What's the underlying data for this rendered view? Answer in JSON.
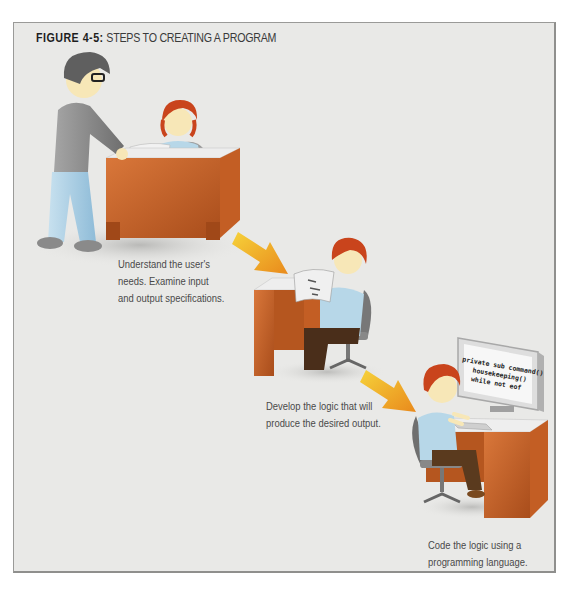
{
  "figure": {
    "label": "FIGURE 4-5:",
    "title": "STEPS TO CREATING A PROGRAM"
  },
  "steps": [
    {
      "caption_lines": [
        "Understand the user's",
        "needs. Examine input",
        "and output specifications."
      ],
      "scene": "analyst-meeting-user-at-desk"
    },
    {
      "caption_lines": [
        "Develop the logic that will",
        "produce the desired output."
      ],
      "scene": "programmer-reading-document-at-desk"
    },
    {
      "caption_lines": [
        "Code the logic using a",
        "programming language."
      ],
      "scene": "programmer-typing-at-computer"
    }
  ],
  "monitor_code": {
    "lines": [
      "private sub command()",
      "housekeeping()",
      "while not eof"
    ]
  },
  "arrows": [
    "arrow-step-1-to-2",
    "arrow-step-2-to-3"
  ],
  "colors": {
    "background": "#e9e9e7",
    "border": "#9a9a98",
    "desk": "#c8652a",
    "arrow_start": "#f6d23a",
    "arrow_end": "#e98a1c",
    "hair": "#c9441c",
    "shirt_blue": "#b7d7e8",
    "pants_blue": "#a9cde3",
    "sweater_gray": "#8c8c8c"
  }
}
